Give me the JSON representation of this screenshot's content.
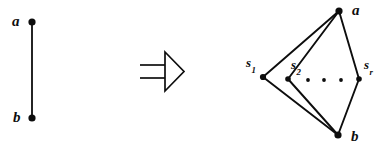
{
  "figure": {
    "kind": "mathematical-graph-transformation-diagram",
    "background_color": "#ffffff",
    "ink_color": "#0d0d0d",
    "width": 386,
    "height": 153
  },
  "left_graph": {
    "caption": "single edge",
    "vertices": [
      {
        "id": "a",
        "label": "a",
        "x": 32,
        "y": 22,
        "label_x": 12,
        "label_y": 14
      },
      {
        "id": "b",
        "label": "b",
        "x": 32,
        "y": 118,
        "label_x": 13,
        "label_y": 110
      }
    ],
    "edges": [
      {
        "from": "a",
        "to": "b"
      }
    ]
  },
  "arrow": {
    "symbol": "=>",
    "name": "double-arrow-implies",
    "x": 140,
    "y": 52,
    "width": 44,
    "height": 40
  },
  "right_graph": {
    "caption": "subdivided / multi-path replacement",
    "vertices": [
      {
        "id": "a",
        "label": "a",
        "sub": "",
        "x": 339,
        "y": 11,
        "label_x": 352,
        "label_y": 3
      },
      {
        "id": "b",
        "label": "b",
        "sub": "",
        "x": 338,
        "y": 135,
        "label_x": 351,
        "label_y": 129
      },
      {
        "id": "s1",
        "label": "s",
        "sub": "1",
        "x": 263,
        "y": 77,
        "label_x": 246,
        "label_y": 56
      },
      {
        "id": "s2",
        "label": "s",
        "sub": "2",
        "x": 288,
        "y": 79,
        "label_x": 291,
        "label_y": 58
      },
      {
        "id": "sr",
        "label": "s",
        "sub": "r",
        "x": 359,
        "y": 79,
        "label_x": 364,
        "label_y": 58
      }
    ],
    "edges": [
      {
        "from": "s1",
        "to": "a"
      },
      {
        "from": "s1",
        "to": "b"
      },
      {
        "from": "s2",
        "to": "a"
      },
      {
        "from": "s2",
        "to": "b"
      },
      {
        "from": "sr",
        "to": "a"
      },
      {
        "from": "sr",
        "to": "b"
      }
    ],
    "ellipsis_dots": [
      {
        "x": 308,
        "y": 80
      },
      {
        "x": 324,
        "y": 80
      },
      {
        "x": 341,
        "y": 80
      }
    ]
  }
}
